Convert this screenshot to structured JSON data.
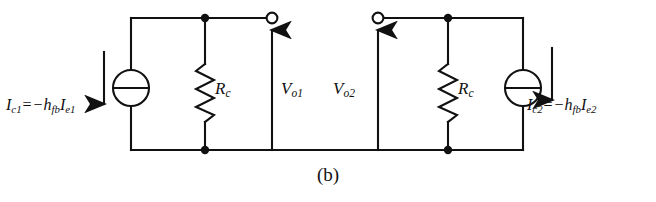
{
  "figure": {
    "caption": "(b)",
    "background_color": "#ffffff",
    "line_color": "#111111"
  },
  "labels": {
    "current_left": {
      "symbol": "I",
      "symbol_sub": "c1",
      "equals": "=",
      "minus": "−",
      "gain": "h",
      "gain_sub": "fb",
      "current": "I",
      "current_sub": "e1",
      "full_text": "Ic1 = −hfb Ie1"
    },
    "current_right": {
      "symbol": "I",
      "symbol_sub": "c2",
      "equals": "=",
      "minus": "−",
      "gain": "h",
      "gain_sub": "fb",
      "current": "I",
      "current_sub": "e2",
      "full_text": "Ic2 = −hfb Ie2"
    },
    "resistor_left": {
      "symbol": "R",
      "symbol_sub": "c"
    },
    "resistor_right": {
      "symbol": "R",
      "symbol_sub": "c"
    },
    "output_left": {
      "symbol": "V",
      "symbol_sub": "o1"
    },
    "output_right": {
      "symbol": "V",
      "symbol_sub": "o2"
    }
  },
  "components": {
    "current_source_left": {
      "name": "current-source",
      "shape": "circle-with-bar"
    },
    "current_source_right": {
      "name": "current-source",
      "shape": "circle-with-bar"
    },
    "resistor_left": {
      "name": "resistor",
      "shape": "zigzag"
    },
    "resistor_right": {
      "name": "resistor",
      "shape": "zigzag"
    },
    "terminal_left": {
      "name": "open-terminal",
      "shape": "open-circle"
    },
    "terminal_right": {
      "name": "open-terminal",
      "shape": "open-circle"
    },
    "arrow_current_left": {
      "direction": "down"
    },
    "arrow_current_right": {
      "direction": "down"
    },
    "arrow_output_left": {
      "direction": "up"
    },
    "arrow_output_right": {
      "direction": "up"
    }
  }
}
